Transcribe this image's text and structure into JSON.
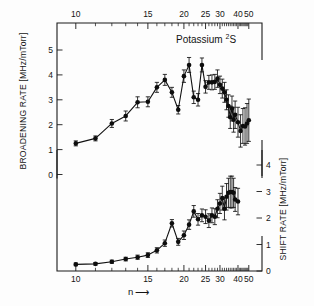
{
  "figure": {
    "title": "Potassium",
    "title_term": "2S",
    "title_superscript": "2",
    "title_letter": "S",
    "xlabel": "n",
    "xlabel_arrow": "⟶",
    "ylabel_left": "BROADENING RATE [MHz/mTorr]",
    "ylabel_right": "SHIFT RATE [MHz/mTorr]",
    "ink_color": "#111111",
    "background_color": "#fdfdfd"
  },
  "chart_data": [
    {
      "type": "scatter",
      "panel": "upper",
      "title": "Potassium 2S",
      "xlabel": "n",
      "ylabel": "BROADENING RATE [MHz/mTorr]",
      "xlim": [
        9.2,
        54
      ],
      "ylim": [
        0,
        5.6
      ],
      "x_scale": "inverse-n",
      "grid": false,
      "legend": "none",
      "xticks": [
        10,
        15,
        20,
        25,
        30,
        40,
        50
      ],
      "xticklabels": [
        "10",
        "15",
        "20",
        "25",
        "30",
        "40",
        "50"
      ],
      "yticks": [
        0,
        1,
        2,
        3,
        4,
        5
      ],
      "yticklabels": [
        "0",
        "1",
        "2",
        "3",
        "4",
        "5"
      ],
      "x": [
        10,
        11,
        12,
        13,
        14,
        15,
        16,
        17,
        18,
        19,
        20,
        21,
        22,
        23,
        24,
        25,
        26,
        27,
        28,
        29,
        30,
        31,
        32,
        33,
        34,
        35,
        36,
        37,
        38,
        40,
        42,
        44,
        46,
        48,
        50
      ],
      "values": [
        1.25,
        1.45,
        2.05,
        2.35,
        2.9,
        2.92,
        3.5,
        3.8,
        3.3,
        2.6,
        3.95,
        4.4,
        3.1,
        3.0,
        4.4,
        3.52,
        3.7,
        3.7,
        3.72,
        3.85,
        3.6,
        3.45,
        3.3,
        3.0,
        2.75,
        2.3,
        2.65,
        2.2,
        2.4,
        2.1,
        1.75,
        1.95,
        1.93,
        2.05,
        2.18
      ],
      "yerr": [
        0.1,
        0.1,
        0.16,
        0.2,
        0.22,
        0.2,
        0.2,
        0.22,
        0.2,
        0.17,
        0.25,
        0.3,
        0.25,
        0.25,
        0.28,
        0.25,
        0.28,
        0.3,
        0.3,
        0.35,
        0.35,
        0.38,
        0.4,
        0.4,
        0.45,
        0.45,
        0.5,
        0.5,
        0.55,
        0.6,
        0.65,
        0.7,
        0.75,
        0.8,
        0.85
      ]
    },
    {
      "type": "scatter",
      "panel": "lower",
      "xlabel": "n",
      "ylabel": "SHIFT RATE [MHz/mTorr]",
      "xlim": [
        9.2,
        54
      ],
      "ylim": [
        0,
        4.5
      ],
      "x_scale": "inverse-n",
      "grid": false,
      "legend": "none",
      "xticks": [
        10,
        15,
        20,
        25,
        30,
        40,
        50
      ],
      "xticklabels": [
        "10",
        "15",
        "20",
        "25",
        "30",
        "40",
        "50"
      ],
      "yticks": [
        0,
        1,
        2,
        3,
        4
      ],
      "yticklabels": [
        "0",
        "1",
        "2",
        "3",
        "4"
      ],
      "x": [
        10,
        11,
        12,
        13,
        14,
        15,
        16,
        17,
        18,
        19,
        20,
        21,
        22,
        23,
        24,
        25,
        26,
        27,
        28,
        29,
        30,
        31,
        32,
        33,
        34,
        35,
        36,
        37,
        38,
        40
      ],
      "values": [
        0.25,
        0.27,
        0.35,
        0.45,
        0.52,
        0.6,
        0.78,
        1.05,
        1.8,
        1.1,
        1.35,
        1.75,
        2.25,
        1.95,
        2.1,
        2.05,
        1.9,
        2.1,
        2.05,
        2.35,
        2.55,
        2.75,
        2.35,
        2.8,
        2.95,
        2.98,
        2.98,
        2.95,
        2.7,
        2.62
      ],
      "yerr": [
        0.05,
        0.05,
        0.06,
        0.07,
        0.08,
        0.09,
        0.1,
        0.12,
        0.14,
        0.13,
        0.16,
        0.18,
        0.22,
        0.22,
        0.24,
        0.26,
        0.26,
        0.28,
        0.3,
        0.34,
        0.38,
        0.45,
        0.42,
        0.5,
        0.55,
        0.6,
        0.6,
        0.55,
        0.45,
        0.5
      ]
    }
  ]
}
